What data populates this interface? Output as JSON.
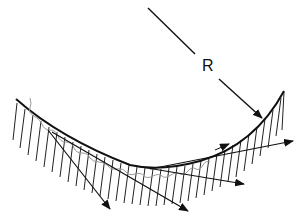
{
  "diagram": {
    "radius_label": "R",
    "colors": {
      "stroke": "#111111",
      "wave": "#9a9a9a",
      "background": "#ffffff"
    },
    "elements": [
      "concave-curved-surface",
      "hatching-below-surface",
      "radius-arrow",
      "wavy-incident-ray",
      "scattered-arrows"
    ]
  }
}
